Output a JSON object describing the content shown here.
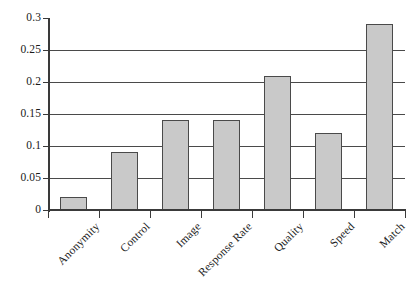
{
  "chart_data": {
    "type": "bar",
    "title": "",
    "subtitle": "",
    "xlabel": "",
    "ylabel": "",
    "categories": [
      "Anonymity",
      "Control",
      "Image",
      "Response Rate",
      "Quality",
      "Speed",
      "Match"
    ],
    "values": [
      0.02,
      0.09,
      0.14,
      0.14,
      0.21,
      0.12,
      0.29
    ],
    "ylim": [
      0,
      0.3
    ],
    "ytick_labels": [
      "0",
      "0.05",
      "0.1",
      "0.15",
      "0.2",
      "0.25",
      "0.3"
    ],
    "ytick_values": [
      0,
      0.05,
      0.1,
      0.15,
      0.2,
      0.25,
      0.3
    ],
    "grid": true,
    "grid_axis": "y",
    "legend": false,
    "legend_position": "none",
    "annotations": [],
    "series": [
      {
        "name": "",
        "values": [
          0.02,
          0.09,
          0.14,
          0.14,
          0.21,
          0.12,
          0.29
        ]
      }
    ],
    "style": {
      "bar_fill": "#c9c9c9",
      "bar_border": "#4a4a4a",
      "axis_color": "#3a3a3a",
      "grid_color": "#4a4a4a",
      "background": "#ffffff",
      "label_rotation_deg": -45
    }
  }
}
